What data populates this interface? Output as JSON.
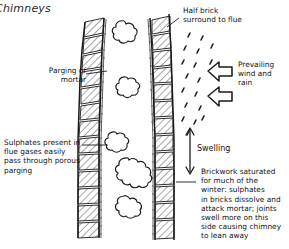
{
  "figure": {
    "title": "Chimneys",
    "type": "technical-cross-section",
    "background_color": "#ffffff",
    "ink_color": "#1a1a1a"
  },
  "annotations": {
    "parging": "Parging of\nmortar",
    "sulphates": "Sulphates present in\nflue gases easily\npass through porous\nparging",
    "half_brick": "Half brick\nsurround to flue",
    "wind": "Prevailing\nwind and\nrain",
    "swelling": "Swelling",
    "brickwork": "Brickwork  saturated\nfor much of the\nwinter: sulphates\nin bricks dissolve and\nattack mortar; joints\nswell more on this\nside causing chimney\nto lean away"
  },
  "elements": {
    "left_wall": "left-brick-wall",
    "right_wall": "right-brick-wall",
    "flue_smoke": "smoke-clouds",
    "rain": "rain-droplets",
    "wind_arrows": "wind-arrows",
    "swelling_arrow": "swelling-dimension-arrow"
  }
}
